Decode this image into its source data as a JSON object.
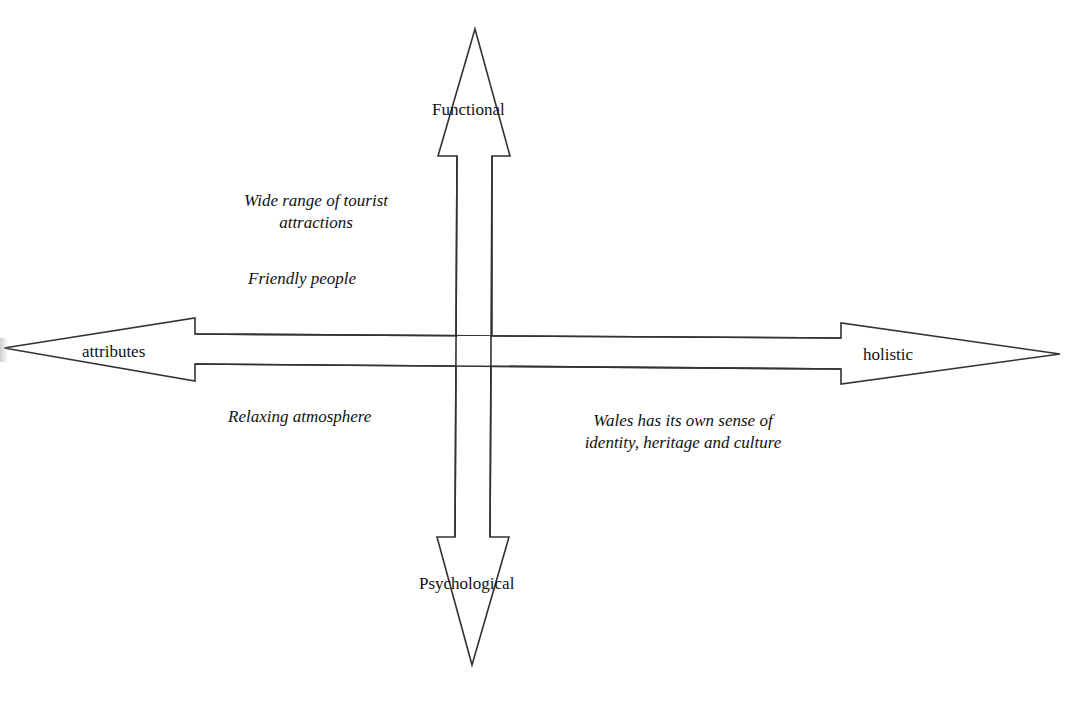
{
  "diagram": {
    "type": "perceptual-positioning-axes",
    "vertical_axis": {
      "top_label": "Functional",
      "bottom_label": "Psychological"
    },
    "horizontal_axis": {
      "left_label": "attributes",
      "right_label": "holistic"
    },
    "quadrants": {
      "top_left": [
        {
          "text": "Wide range of tourist attractions",
          "line1": "Wide range of tourist",
          "line2": "attractions"
        },
        {
          "text": "Friendly people"
        }
      ],
      "top_right": [],
      "bottom_left": [
        {
          "text": "Relaxing atmosphere"
        }
      ],
      "bottom_right": [
        {
          "text": "Wales has its own sense of identity, heritage and culture",
          "line1": "Wales has its own sense of",
          "line2": "identity, heritage and culture"
        }
      ]
    },
    "colors": {
      "stroke": "#333333",
      "fill": "#ffffff",
      "text": "#111111",
      "background": "#ffffff"
    }
  }
}
